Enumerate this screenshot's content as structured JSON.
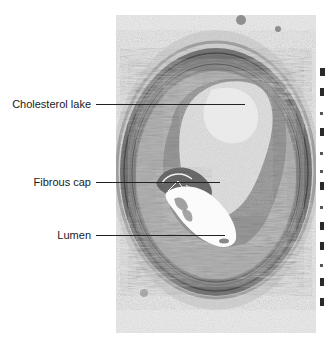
{
  "figure": {
    "labels": [
      {
        "id": "cholesterol-lake",
        "text": "Cholesterol lake"
      },
      {
        "id": "fibrous-cap",
        "text": "Fibrous cap"
      },
      {
        "id": "lumen",
        "text": "Lumen"
      }
    ]
  },
  "colors": {
    "background": "#ffffff",
    "label_text": "#1a1a1a",
    "leader_line": "#222222",
    "tissue_dark": "#6e6e6e",
    "tissue_mid": "#a8a8a8",
    "tissue_light": "#d9d9d9",
    "lumen": "#fbfbfb"
  }
}
